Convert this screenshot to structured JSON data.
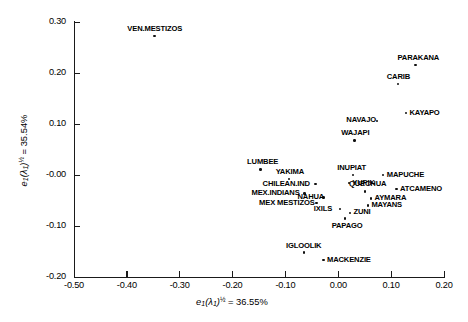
{
  "chart_data": {
    "type": "scatter",
    "title": "",
    "xlabel": "e1(λ1)½ = 36.55%",
    "ylabel": "e1(λ1)½ = 35.54%",
    "xlim": [
      -0.5,
      0.2
    ],
    "ylim": [
      -0.2,
      0.3
    ],
    "xticks": [
      "-0.50",
      "-0.40",
      "-0.30",
      "-0.20",
      "-0.10",
      "0.00",
      "0.10",
      "0.20"
    ],
    "xtick_values": [
      -0.5,
      -0.4,
      -0.3,
      -0.2,
      -0.1,
      0.0,
      0.1,
      0.2
    ],
    "yticks": [
      "0.30",
      "0.20",
      "0.10",
      "-0.00",
      "-0.10",
      "-0.20"
    ],
    "ytick_values": [
      0.3,
      0.2,
      0.1,
      0.0,
      -0.1,
      -0.2
    ],
    "grid": false,
    "legend": "none",
    "points": [
      {
        "label": "VEN.MESTIZOS",
        "x": -0.348,
        "y": 0.273,
        "lpos": "above"
      },
      {
        "label": "PARAKANA",
        "x": 0.146,
        "y": 0.216,
        "lpos": "above"
      },
      {
        "label": "CARIB",
        "x": 0.113,
        "y": 0.178,
        "lpos": "above"
      },
      {
        "label": "KAYAPO",
        "x": 0.128,
        "y": 0.121,
        "lpos": "right"
      },
      {
        "label": "NAVAJO",
        "x": 0.073,
        "y": 0.106,
        "lpos": "left"
      },
      {
        "label": "WAJAPI",
        "x": 0.031,
        "y": 0.068,
        "lpos": "above"
      },
      {
        "label": "LUMBEE",
        "x": -0.147,
        "y": 0.011,
        "lpos": "above"
      },
      {
        "label": "INUPIAT",
        "x": 0.028,
        "y": 0.0,
        "lpos": "above"
      },
      {
        "label": "MAPUCHE",
        "x": 0.085,
        "y": 0.0,
        "lpos": "right"
      },
      {
        "label": "YAKIMA",
        "x": -0.093,
        "y": -0.008,
        "lpos": "above"
      },
      {
        "label": "YUPIK",
        "x": 0.02,
        "y": -0.016,
        "lpos": "right"
      },
      {
        "label": "CHILEAN.IND",
        "x": -0.043,
        "y": -0.018,
        "lpos": "left"
      },
      {
        "label": "QUECHUA",
        "x": 0.05,
        "y": -0.032,
        "lpos": "above"
      },
      {
        "label": "ATCAMENO",
        "x": 0.11,
        "y": -0.028,
        "lpos": "right"
      },
      {
        "label": "MEX.INDIANS",
        "x": -0.064,
        "y": -0.036,
        "lpos": "left"
      },
      {
        "label": "NAHUA",
        "x": -0.028,
        "y": -0.044,
        "lpos": "left"
      },
      {
        "label": "AYMARA",
        "x": 0.062,
        "y": -0.046,
        "lpos": "right"
      },
      {
        "label": "MEX MESTIZOS",
        "x": -0.041,
        "y": -0.055,
        "lpos": "left"
      },
      {
        "label": "MAYANS",
        "x": 0.056,
        "y": -0.06,
        "lpos": "right"
      },
      {
        "label": "IXILS",
        "x": 0.003,
        "y": -0.067,
        "lpos": "left"
      },
      {
        "label": "ZUNI",
        "x": 0.022,
        "y": -0.074,
        "lpos": "right"
      },
      {
        "label": "PAPAGO",
        "x": 0.013,
        "y": -0.085,
        "lpos": "below"
      },
      {
        "label": "IGLOOLIK",
        "x": -0.065,
        "y": -0.152,
        "lpos": "above"
      },
      {
        "label": "MACKENZIE",
        "x": -0.028,
        "y": -0.167,
        "lpos": "right"
      }
    ]
  },
  "axis": {
    "x_title_base": "e",
    "x_title_sub": "1",
    "x_title_lambda": "(λ",
    "x_title_lambda_sub": "1",
    "x_title_close": ")",
    "x_title_exp": "½",
    "x_title_eq": " = 36.55%",
    "y_title_eq": " = 35.54%"
  }
}
